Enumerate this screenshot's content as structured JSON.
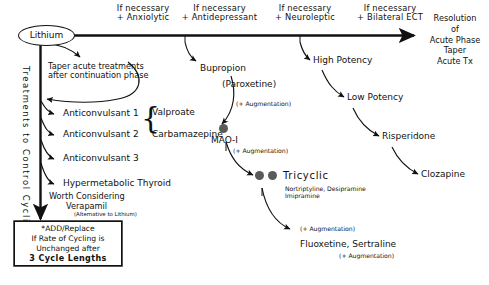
{
  "diagram": {
    "accent_color": "#111111",
    "dot_color": "#5a5a5a"
  },
  "top_path": {
    "start_node": "Lithium",
    "steps": [
      {
        "line1": "If necessary",
        "line2": "+ Anxiolytic"
      },
      {
        "line1": "If necessary",
        "line2": "+ Antidepressant"
      },
      {
        "line1": "If necessary",
        "line2": "+ Neuroleptic"
      },
      {
        "line1": "If necessary",
        "line2": "+ Bilateral ECT"
      }
    ],
    "endpoint": "Resolution\nof\nAcute Phase\nTaper\nAcute Tx",
    "endpoint_lines": [
      "Resolution",
      "of",
      "Acute Phase",
      "Taper",
      "Acute Tx"
    ]
  },
  "left_branch": {
    "axis_label": "Treatments  to  Control  Cycling",
    "taper_note_line1": "Taper acute treatments",
    "taper_note_line2": "after continuation phase",
    "items": [
      {
        "label": "Anticonvulsant  1",
        "drug": "Valproate"
      },
      {
        "label": "Anticonvulsant  2",
        "drug": "Carbamazepine"
      },
      {
        "label": "Anticonvulsant  3",
        "drug": ""
      },
      {
        "label": "Hypermetabolic  Thyroid",
        "drug": ""
      }
    ],
    "consider_line1": "Worth  Considering",
    "consider_line2": "Verapamil",
    "consider_line3": "(Alternative to Lithium)",
    "box": {
      "line1": "*ADD/Replace",
      "line2": "If Rate of Cycling is",
      "line3": "Unchanged after",
      "line4": "3  Cycle  Lengths"
    }
  },
  "antidepressant_branch": {
    "node1": "Bupropion",
    "node1_alt": "(Paroxetine)",
    "aug1": "(+ Augmentation)",
    "node2": "MAO-I",
    "aug2": "(+ Augmentation)",
    "node3": "Tricyclic",
    "node3_drugs_line1": "Nortriptyline, Desipramine",
    "node3_drugs_line2": "Imipramine",
    "aug3": "(+ Augmentation)",
    "node4": "Fluoxetine,  Sertraline",
    "aug4": "(+ Augmentation)"
  },
  "neuroleptic_branch": {
    "items": [
      "High Potency",
      "Low Potency",
      "Risperidone",
      "Clozapine"
    ]
  }
}
